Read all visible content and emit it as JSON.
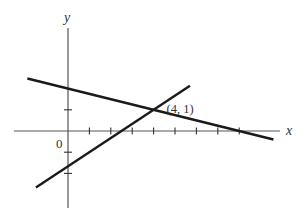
{
  "chart_data": {
    "type": "line",
    "title": "",
    "xlabel": "x",
    "ylabel": "y",
    "origin_label": "0",
    "xlim": [
      -2.5,
      10.3
    ],
    "ylim": [
      -3.6,
      4.3
    ],
    "x_ticks": [
      1,
      2,
      3,
      4,
      5,
      6,
      7,
      8
    ],
    "y_ticks": [
      -2,
      -1,
      1,
      2
    ],
    "grid": false,
    "series": [
      {
        "name": "line-1",
        "equation": "x + 4y = 8",
        "slope": -0.25,
        "intercept": 2,
        "x_range": [
          -1.9,
          9.6
        ]
      },
      {
        "name": "line-2",
        "equation": "2x - 3y = 5",
        "slope": 0.6667,
        "intercept": -1.6667,
        "x_range": [
          -1.5,
          5.7
        ]
      }
    ],
    "annotations": [
      {
        "text": "(4, 1)",
        "x": 4,
        "y": 1
      }
    ]
  }
}
